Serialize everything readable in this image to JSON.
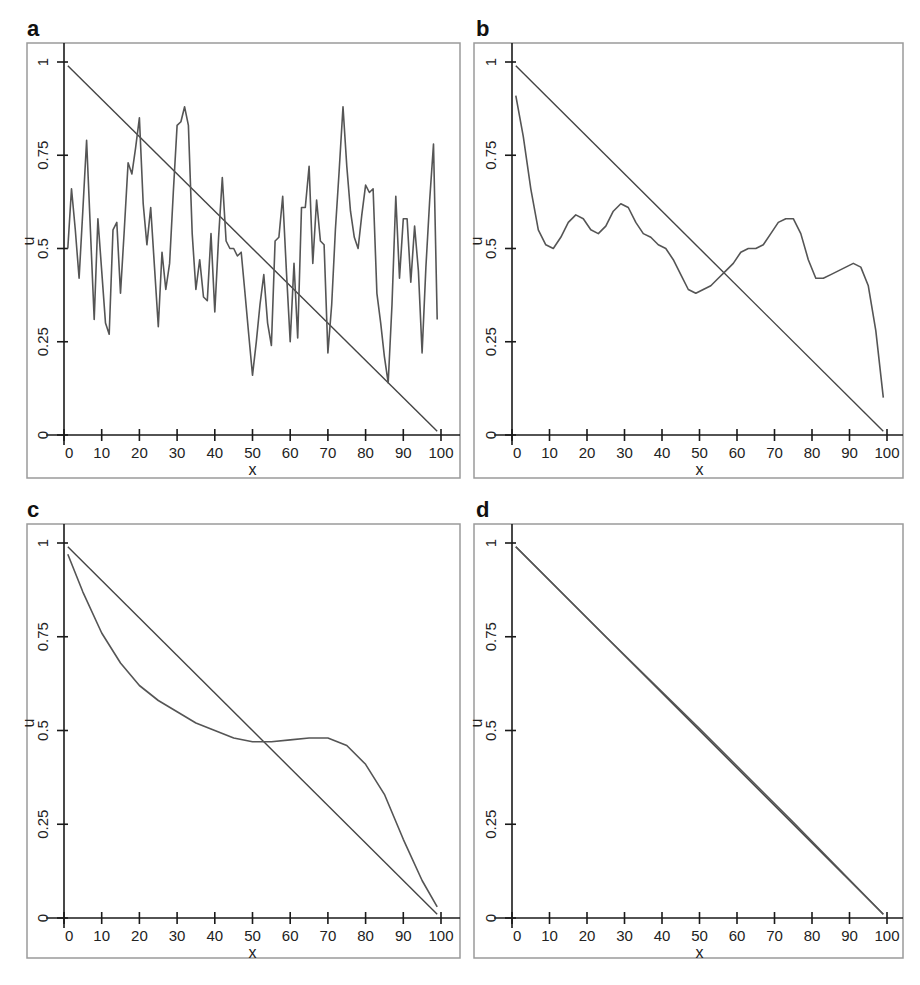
{
  "chart_data": [
    {
      "panel": "a",
      "type": "line",
      "xlabel": "x",
      "ylabel": "u",
      "xlim": [
        0,
        100
      ],
      "ylim": [
        0,
        1
      ],
      "xticks": [
        "0",
        "10",
        "20",
        "30",
        "40",
        "50",
        "60",
        "70",
        "80",
        "90",
        "100"
      ],
      "yticks": [
        "0",
        "0.25",
        "0.5",
        "0.75",
        "1"
      ],
      "grid": false,
      "series": [
        {
          "name": "reference",
          "x": [
            1,
            99
          ],
          "values": [
            0.99,
            0.01
          ]
        },
        {
          "name": "solution",
          "x": [
            1,
            2,
            3,
            4,
            5,
            6,
            7,
            8,
            9,
            10,
            11,
            12,
            13,
            14,
            15,
            16,
            17,
            18,
            19,
            20,
            21,
            22,
            23,
            24,
            25,
            26,
            27,
            28,
            29,
            30,
            31,
            32,
            33,
            34,
            35,
            36,
            37,
            38,
            39,
            40,
            41,
            42,
            43,
            44,
            45,
            46,
            47,
            48,
            49,
            50,
            51,
            52,
            53,
            54,
            55,
            56,
            57,
            58,
            59,
            60,
            61,
            62,
            63,
            64,
            65,
            66,
            67,
            68,
            69,
            70,
            71,
            72,
            73,
            74,
            75,
            76,
            77,
            78,
            79,
            80,
            81,
            82,
            83,
            84,
            85,
            86,
            87,
            88,
            89,
            90,
            91,
            92,
            93,
            94,
            95,
            96,
            97,
            98,
            99
          ],
          "values": [
            0.5,
            0.66,
            0.55,
            0.42,
            0.6,
            0.79,
            0.55,
            0.31,
            0.58,
            0.44,
            0.3,
            0.27,
            0.55,
            0.57,
            0.38,
            0.55,
            0.73,
            0.7,
            0.77,
            0.85,
            0.62,
            0.51,
            0.61,
            0.45,
            0.29,
            0.49,
            0.39,
            0.46,
            0.65,
            0.83,
            0.84,
            0.88,
            0.83,
            0.54,
            0.39,
            0.47,
            0.37,
            0.36,
            0.54,
            0.33,
            0.53,
            0.69,
            0.52,
            0.5,
            0.5,
            0.48,
            0.49,
            0.38,
            0.27,
            0.16,
            0.25,
            0.35,
            0.43,
            0.3,
            0.24,
            0.52,
            0.53,
            0.64,
            0.44,
            0.25,
            0.46,
            0.26,
            0.61,
            0.61,
            0.72,
            0.46,
            0.63,
            0.52,
            0.51,
            0.22,
            0.35,
            0.55,
            0.71,
            0.88,
            0.72,
            0.6,
            0.53,
            0.5,
            0.59,
            0.67,
            0.65,
            0.66,
            0.38,
            0.3,
            0.21,
            0.14,
            0.35,
            0.64,
            0.42,
            0.58,
            0.58,
            0.41,
            0.56,
            0.44,
            0.22,
            0.45,
            0.63,
            0.78,
            0.31
          ]
        }
      ]
    },
    {
      "panel": "b",
      "type": "line",
      "xlabel": "x",
      "ylabel": "u",
      "xlim": [
        0,
        100
      ],
      "ylim": [
        0,
        1
      ],
      "xticks": [
        "0",
        "10",
        "20",
        "30",
        "40",
        "50",
        "60",
        "70",
        "80",
        "90",
        "100"
      ],
      "yticks": [
        "0",
        "0.25",
        "0.5",
        "0.75",
        "1"
      ],
      "grid": false,
      "series": [
        {
          "name": "reference",
          "x": [
            1,
            99
          ],
          "values": [
            0.99,
            0.01
          ]
        },
        {
          "name": "solution",
          "x": [
            1,
            3,
            5,
            7,
            9,
            11,
            13,
            15,
            17,
            19,
            21,
            23,
            25,
            27,
            29,
            31,
            33,
            35,
            37,
            39,
            41,
            43,
            45,
            47,
            49,
            51,
            53,
            55,
            57,
            59,
            61,
            63,
            65,
            67,
            69,
            71,
            73,
            75,
            77,
            79,
            81,
            83,
            85,
            87,
            89,
            91,
            93,
            95,
            97,
            99
          ],
          "values": [
            0.91,
            0.8,
            0.66,
            0.55,
            0.51,
            0.5,
            0.53,
            0.57,
            0.59,
            0.58,
            0.55,
            0.54,
            0.56,
            0.6,
            0.62,
            0.61,
            0.57,
            0.54,
            0.53,
            0.51,
            0.5,
            0.47,
            0.43,
            0.39,
            0.38,
            0.39,
            0.4,
            0.42,
            0.44,
            0.46,
            0.49,
            0.5,
            0.5,
            0.51,
            0.54,
            0.57,
            0.58,
            0.58,
            0.54,
            0.47,
            0.42,
            0.42,
            0.43,
            0.44,
            0.45,
            0.46,
            0.45,
            0.4,
            0.28,
            0.1
          ]
        }
      ]
    },
    {
      "panel": "c",
      "type": "line",
      "xlabel": "x",
      "ylabel": "u",
      "xlim": [
        0,
        100
      ],
      "ylim": [
        0,
        1
      ],
      "xticks": [
        "0",
        "10",
        "20",
        "30",
        "40",
        "50",
        "60",
        "70",
        "80",
        "90",
        "100"
      ],
      "yticks": [
        "0",
        "0.25",
        "0.5",
        "0.75",
        "1"
      ],
      "grid": false,
      "series": [
        {
          "name": "reference",
          "x": [
            1,
            99
          ],
          "values": [
            0.99,
            0.01
          ]
        },
        {
          "name": "solution",
          "x": [
            1,
            5,
            10,
            15,
            20,
            25,
            30,
            35,
            40,
            45,
            50,
            55,
            60,
            65,
            70,
            75,
            80,
            85,
            90,
            95,
            99
          ],
          "values": [
            0.97,
            0.87,
            0.76,
            0.68,
            0.62,
            0.58,
            0.55,
            0.52,
            0.5,
            0.48,
            0.47,
            0.47,
            0.475,
            0.48,
            0.48,
            0.46,
            0.41,
            0.33,
            0.21,
            0.1,
            0.03
          ]
        }
      ]
    },
    {
      "panel": "d",
      "type": "line",
      "xlabel": "x",
      "ylabel": "u",
      "xlim": [
        0,
        100
      ],
      "ylim": [
        0,
        1
      ],
      "xticks": [
        "0",
        "10",
        "20",
        "30",
        "40",
        "50",
        "60",
        "70",
        "80",
        "90",
        "100"
      ],
      "yticks": [
        "0",
        "0.25",
        "0.5",
        "0.75",
        "1"
      ],
      "grid": false,
      "series": [
        {
          "name": "reference",
          "x": [
            1,
            99
          ],
          "values": [
            0.99,
            0.01
          ]
        },
        {
          "name": "solution",
          "x": [
            1,
            25,
            50,
            75,
            99
          ],
          "values": [
            0.99,
            0.75,
            0.505,
            0.255,
            0.01
          ]
        }
      ]
    }
  ],
  "panels": [
    {
      "label": "a",
      "xlabel": "x",
      "ylabel": "u"
    },
    {
      "label": "b",
      "xlabel": "x",
      "ylabel": "u"
    },
    {
      "label": "c",
      "xlabel": "x",
      "ylabel": "u"
    },
    {
      "label": "d",
      "xlabel": "x",
      "ylabel": "u"
    }
  ]
}
